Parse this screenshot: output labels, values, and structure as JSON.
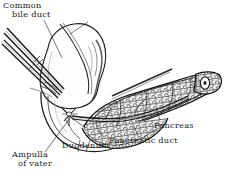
{
  "figure": {
    "background_color": "#ffffff",
    "ink_color": "#1a1a1a",
    "width": 227,
    "height": 180
  },
  "labels": {
    "common_bile_duct": {
      "line1": "Common",
      "line2": "bile duct"
    },
    "ampulla_of_vater": {
      "line1": "Ampulla",
      "line2": "of vater"
    },
    "duodenum": "Duodenum",
    "pancreas": "Pancreas",
    "pancreatic_duct": "Pancreatic duct"
  },
  "structures": [
    {
      "name": "common-bile-duct",
      "description": "paired parallel tubular duct entering from upper left"
    },
    {
      "name": "duodenum",
      "description": "large pale C-shaped lobed loop at center left"
    },
    {
      "name": "ampulla-of-vater",
      "description": "small duct convergence on the medial duodenal wall"
    },
    {
      "name": "pancreas",
      "description": "elongated stippled lobular gland extending to the right"
    },
    {
      "name": "pancreatic-duct",
      "description": "duct running lengthwise within the pancreas"
    }
  ]
}
